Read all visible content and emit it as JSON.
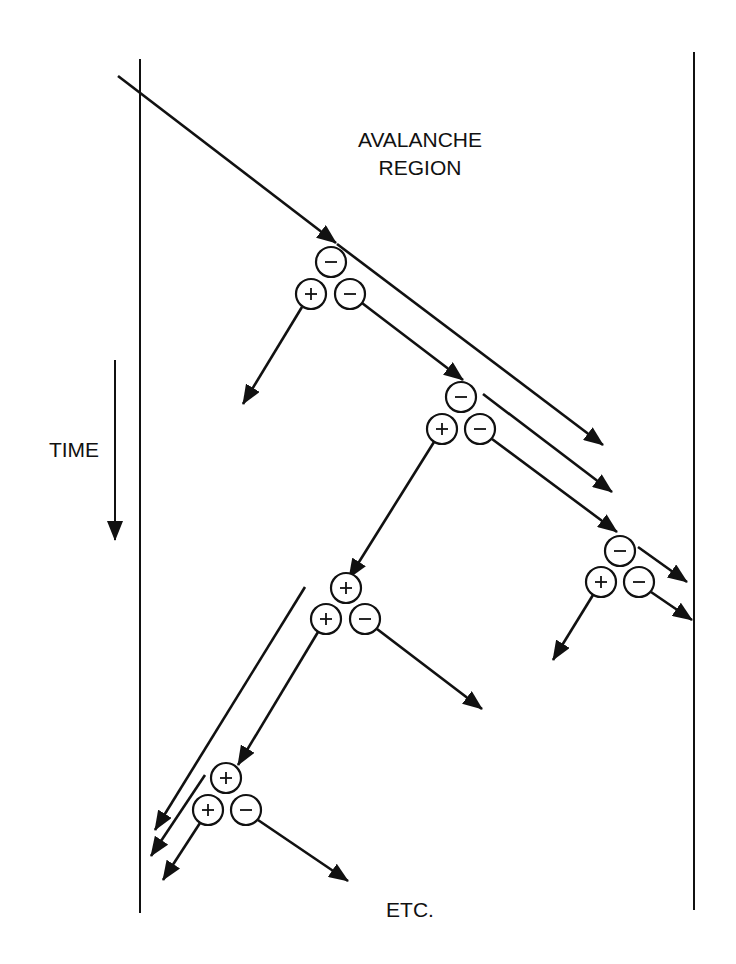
{
  "labels": {
    "region_line1": "AVALANCHE",
    "region_line2": "REGION",
    "time": "TIME",
    "etc": "ETC."
  },
  "colors": {
    "ink": "#111111",
    "background": "#ffffff"
  },
  "borders": [
    {
      "name": "left-boundary",
      "x": 140,
      "y1": 59,
      "y2": 913
    },
    {
      "name": "right-boundary",
      "x": 694,
      "y1": 52,
      "y2": 910
    }
  ],
  "time_arrow": {
    "x": 115,
    "y1": 360,
    "y2": 540
  },
  "carrier_groups": [
    {
      "name": "ionization-1",
      "carriers": [
        {
          "sign": "−",
          "x": 331,
          "y": 262
        },
        {
          "sign": "+",
          "x": 311,
          "y": 294
        },
        {
          "sign": "−",
          "x": 350,
          "y": 294
        }
      ]
    },
    {
      "name": "ionization-2",
      "carriers": [
        {
          "sign": "−",
          "x": 461,
          "y": 397
        },
        {
          "sign": "+",
          "x": 442,
          "y": 429
        },
        {
          "sign": "−",
          "x": 480,
          "y": 429
        }
      ]
    },
    {
      "name": "ionization-3",
      "carriers": [
        {
          "sign": "−",
          "x": 620,
          "y": 551
        },
        {
          "sign": "+",
          "x": 601,
          "y": 582
        },
        {
          "sign": "−",
          "x": 639,
          "y": 582
        }
      ]
    },
    {
      "name": "ionization-4",
      "carriers": [
        {
          "sign": "+",
          "x": 346,
          "y": 588
        },
        {
          "sign": "+",
          "x": 326,
          "y": 619
        },
        {
          "sign": "−",
          "x": 365,
          "y": 619
        }
      ]
    },
    {
      "name": "ionization-5",
      "carriers": [
        {
          "sign": "+",
          "x": 226,
          "y": 778
        },
        {
          "sign": "+",
          "x": 208,
          "y": 810
        },
        {
          "sign": "−",
          "x": 246,
          "y": 810
        }
      ]
    }
  ],
  "arrows": [
    {
      "name": "incoming-electron",
      "x1": 118,
      "y1": 76,
      "x2": 336,
      "y2": 243,
      "head": true
    },
    {
      "name": "electron-1-continue",
      "x1": 337,
      "y1": 244,
      "x2": 603,
      "y2": 445,
      "head": true
    },
    {
      "name": "hole-1",
      "x1": 302,
      "y1": 307,
      "x2": 243,
      "y2": 404,
      "head": true
    },
    {
      "name": "electron-1-new",
      "x1": 362,
      "y1": 303,
      "x2": 463,
      "y2": 380,
      "head": true
    },
    {
      "name": "electron-2-continue",
      "x1": 483,
      "y1": 394,
      "x2": 612,
      "y2": 492,
      "head": true
    },
    {
      "name": "electron-2-new",
      "x1": 492,
      "y1": 439,
      "x2": 617,
      "y2": 532,
      "head": true
    },
    {
      "name": "hole-2",
      "x1": 434,
      "y1": 442,
      "x2": 349,
      "y2": 578,
      "head": true
    },
    {
      "name": "electron-3-continue",
      "x1": 638,
      "y1": 547,
      "x2": 687,
      "y2": 582,
      "head": true
    },
    {
      "name": "electron-3-new",
      "x1": 651,
      "y1": 592,
      "x2": 692,
      "y2": 620,
      "head": true
    },
    {
      "name": "hole-3",
      "x1": 593,
      "y1": 595,
      "x2": 553,
      "y2": 660,
      "head": true
    },
    {
      "name": "hole-4-continue",
      "x1": 305,
      "y1": 587,
      "x2": 155,
      "y2": 830,
      "head": true
    },
    {
      "name": "hole-4-new",
      "x1": 318,
      "y1": 632,
      "x2": 238,
      "y2": 765,
      "head": true
    },
    {
      "name": "electron-4-new",
      "x1": 377,
      "y1": 629,
      "x2": 482,
      "y2": 709,
      "head": true
    },
    {
      "name": "hole-5-continue",
      "x1": 205,
      "y1": 775,
      "x2": 151,
      "y2": 856,
      "head": true
    },
    {
      "name": "hole-5-new",
      "x1": 200,
      "y1": 823,
      "x2": 163,
      "y2": 880,
      "head": true
    },
    {
      "name": "electron-5-new",
      "x1": 258,
      "y1": 820,
      "x2": 348,
      "y2": 881,
      "head": true
    }
  ]
}
